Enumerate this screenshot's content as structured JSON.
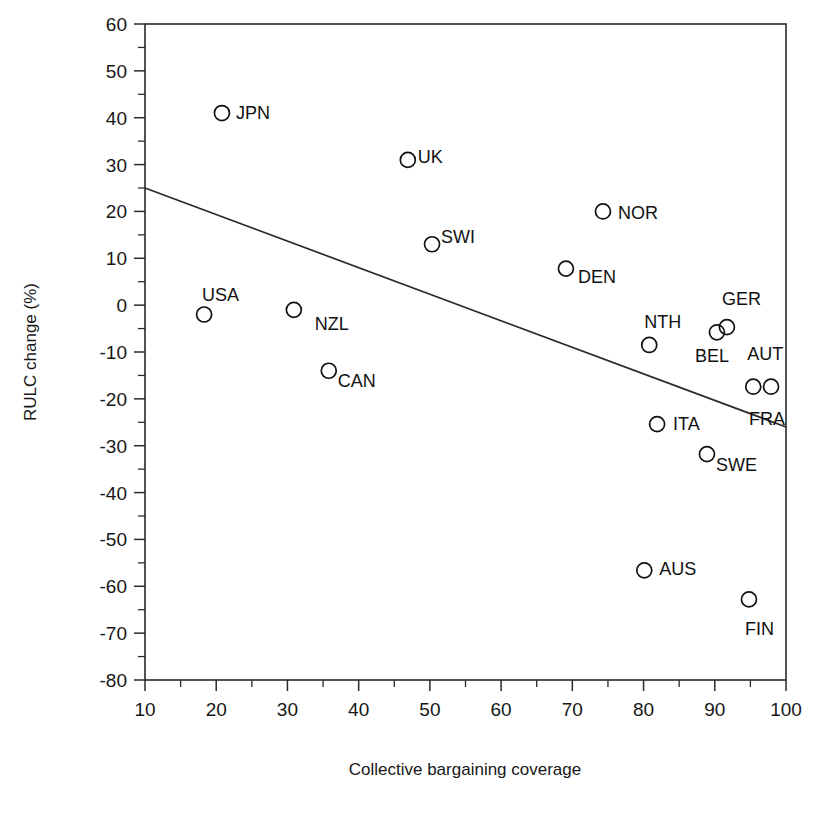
{
  "chart_data": {
    "type": "scatter",
    "title": "",
    "xlabel": "Collective bargaining coverage",
    "ylabel": "RULC change (%)",
    "xlim": [
      10,
      100
    ],
    "ylim": [
      -80,
      60
    ],
    "xticks": [
      10,
      20,
      30,
      40,
      50,
      60,
      70,
      80,
      90,
      100
    ],
    "yticks": [
      60,
      50,
      40,
      30,
      20,
      10,
      0,
      -10,
      -20,
      -30,
      -40,
      -50,
      -60,
      -70,
      -80
    ],
    "xtick_labels": [
      "10",
      "20",
      "30",
      "40",
      "50",
      "60",
      "70",
      "80",
      "90",
      "100"
    ],
    "ytick_labels": [
      "60",
      "50",
      "40",
      "30",
      "20",
      "10",
      "0",
      "-10",
      "-20",
      "-30",
      "-40",
      "-50",
      "-60",
      "-70",
      "-80"
    ],
    "minor_tick_step_x": 5,
    "minor_tick_step_y": 5,
    "grid": false,
    "legend": false,
    "marker_style": "open-circle",
    "points": [
      {
        "label": "JPN",
        "x": 20.8,
        "y": 41.0,
        "label_dx": 14,
        "label_dy": 6
      },
      {
        "label": "UK",
        "x": 46.9,
        "y": 31.0,
        "label_dx": 10,
        "label_dy": 3
      },
      {
        "label": "NOR",
        "x": 74.3,
        "y": 20.0,
        "label_dx": 15,
        "label_dy": 8
      },
      {
        "label": "SWI",
        "x": 50.3,
        "y": 13.0,
        "label_dx": 9,
        "label_dy": -1
      },
      {
        "label": "DEN",
        "x": 69.1,
        "y": 7.8,
        "label_dx": 12,
        "label_dy": 14
      },
      {
        "label": "USA",
        "x": 18.3,
        "y": -2.0,
        "label_dx": -2,
        "label_dy": -14
      },
      {
        "label": "NZL",
        "x": 30.9,
        "y": -1.0,
        "label_dx": 21,
        "label_dy": 20
      },
      {
        "label": "NTH",
        "x": 80.8,
        "y": -8.5,
        "label_dx": -5,
        "label_dy": -17
      },
      {
        "label": "BEL",
        "x": 90.3,
        "y": -5.8,
        "label_dx": -22,
        "label_dy": 30
      },
      {
        "label": "GER",
        "x": 91.7,
        "y": -4.7,
        "label_dx": -5,
        "label_dy": -22
      },
      {
        "label": "CAN",
        "x": 35.8,
        "y": -14.0,
        "label_dx": 9,
        "label_dy": 16
      },
      {
        "label": "AUT",
        "x": 95.4,
        "y": -17.4,
        "label_dx": -6,
        "label_dy": -27
      },
      {
        "label": "FRA",
        "x": 97.9,
        "y": -17.4,
        "label_dx": -22,
        "label_dy": 38
      },
      {
        "label": "ITA",
        "x": 81.9,
        "y": -25.4,
        "label_dx": 16,
        "label_dy": 6
      },
      {
        "label": "SWE",
        "x": 88.9,
        "y": -31.8,
        "label_dx": 9,
        "label_dy": 17
      },
      {
        "label": "AUS",
        "x": 80.1,
        "y": -56.6,
        "label_dx": 15,
        "label_dy": 5
      },
      {
        "label": "FIN",
        "x": 94.8,
        "y": -62.8,
        "label_dx": -4,
        "label_dy": 36
      }
    ],
    "trendline": {
      "x0": 10,
      "y0": 25.0,
      "x1": 100,
      "y1": -26.0
    }
  }
}
